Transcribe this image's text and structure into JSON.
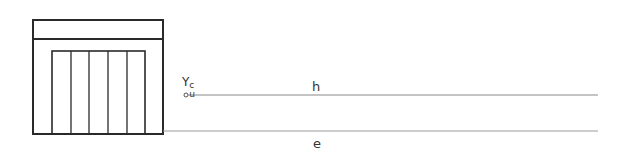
{
  "diagram": {
    "labels": {
      "point_symbol": "Y",
      "point_superscript": "c",
      "point_subscript": "u",
      "upper_line": "h",
      "lower_line": "e"
    },
    "colors": {
      "frame": "#2a2a2a",
      "line": "#8a8a8a",
      "background": "#ffffff"
    },
    "frame": {
      "x": 33,
      "y": 20,
      "w": 130,
      "h": 114,
      "band_y": 39
    },
    "inner_panel": {
      "x": 52,
      "y": 51,
      "w": 93,
      "h": 83,
      "slats": 5
    },
    "upper_line": {
      "x1": 186,
      "x2": 598,
      "y": 95
    },
    "lower_line": {
      "x1": 163,
      "x2": 598,
      "y": 131
    }
  }
}
